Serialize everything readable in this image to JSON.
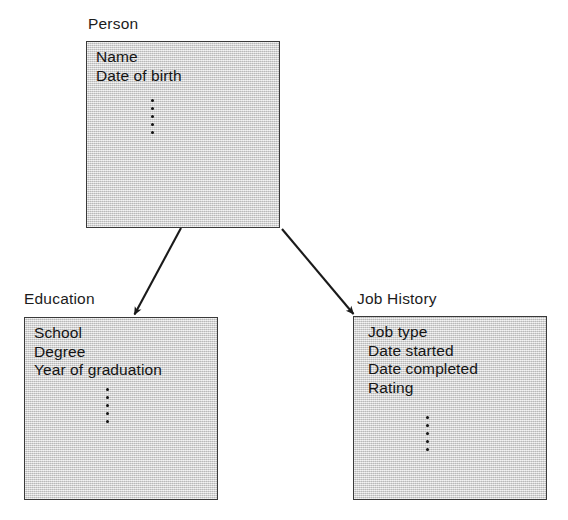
{
  "diagram": {
    "background_color": "#ffffff",
    "box_fill_color": "#d4d4d4",
    "box_border_color": "#3a3a3a",
    "text_color": "#141414",
    "entities": [
      {
        "id": "person",
        "label": "Person",
        "attributes": [
          "Name",
          "Date of birth"
        ],
        "ellipsis_dot_count": 5
      },
      {
        "id": "education",
        "label": "Education",
        "attributes": [
          "School",
          "Degree",
          "Year of graduation"
        ],
        "ellipsis_dot_count": 5
      },
      {
        "id": "job-history",
        "label": "Job History",
        "attributes": [
          "Job type",
          "Date started",
          "Date completed",
          "Rating"
        ],
        "ellipsis_dot_count": 5
      }
    ],
    "connections": [
      {
        "from": "person",
        "to": "education",
        "style": "arrow"
      },
      {
        "from": "person",
        "to": "job-history",
        "style": "arrow"
      }
    ]
  }
}
